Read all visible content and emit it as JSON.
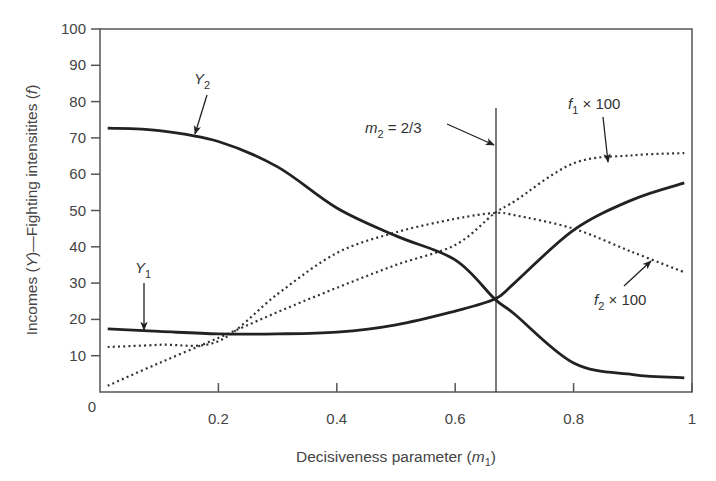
{
  "chart_data": {
    "type": "line",
    "title": "",
    "xlabel": "Decisiveness parameter (m1)",
    "xlabel_parts": {
      "main": "Decisiveness parameter (",
      "var": "m",
      "sub": "1",
      "close": ")"
    },
    "ylabel": "Incomes (Y)—Fighting intensitites (f)",
    "ylabel_parts": {
      "a": "Incomes (",
      "b": "Y",
      "c": ")—Fighting intensitites (",
      "d": "f",
      "e": ")"
    },
    "xlim": [
      0,
      1
    ],
    "ylim": [
      0,
      100
    ],
    "xticks": [
      0.2,
      0.4,
      0.6,
      0.8,
      1
    ],
    "xtick_labels": [
      "0.2",
      "0.4",
      "0.6",
      "0.8",
      "1"
    ],
    "origin_label": "0",
    "yticks": [
      10,
      20,
      30,
      40,
      50,
      60,
      70,
      80,
      90,
      100
    ],
    "ytick_labels": [
      "10",
      "20",
      "30",
      "40",
      "50",
      "60",
      "70",
      "80",
      "90",
      "100"
    ],
    "grid": false,
    "legend": "none (inline annotations)",
    "x": [
      0.013,
      0.1,
      0.2,
      0.3,
      0.4,
      0.5,
      0.6,
      0.667,
      0.7,
      0.8,
      0.9,
      0.987
    ],
    "series": [
      {
        "name": "Y2",
        "style": "solid",
        "values": [
          72.7,
          72.0,
          69.0,
          62.0,
          50.7,
          43.0,
          36.4,
          25.6,
          21.5,
          8.0,
          4.8,
          3.9
        ]
      },
      {
        "name": "Y1",
        "style": "solid",
        "values": [
          17.4,
          16.7,
          16.0,
          16.0,
          16.5,
          18.5,
          22.3,
          25.6,
          30.0,
          44.6,
          53.0,
          57.6
        ]
      },
      {
        "name": "f1 × 100",
        "style": "dotted",
        "values": [
          1.7,
          8.0,
          14.9,
          22.0,
          28.7,
          35.0,
          40.5,
          49.3,
          52.5,
          63.0,
          65.2,
          65.8
        ]
      },
      {
        "name": "f2 × 100",
        "style": "dotted",
        "values": [
          12.4,
          13.0,
          14.0,
          27.0,
          38.3,
          44.0,
          47.7,
          49.3,
          48.7,
          45.0,
          38.5,
          33.0
        ]
      }
    ],
    "annotations": [
      {
        "text": "Y2",
        "main": "Y",
        "sub": "2",
        "points_to": "Y2 curve near m1=0.16"
      },
      {
        "text": "Y1",
        "main": "Y",
        "sub": "1",
        "points_to": "Y1 curve near m1=0.07"
      },
      {
        "text": "m2 = 2/3",
        "main": "m",
        "sub": "2",
        "rest": " = 2/3",
        "points_to": "vertical line at m1=2/3"
      },
      {
        "text": "f1 × 100",
        "main": "f",
        "sub": "1",
        "rest": " × 100",
        "points_to": "f1 curve near m1=0.86"
      },
      {
        "text": "f2 × 100",
        "main": "f",
        "sub": "2",
        "rest": " × 100",
        "points_to": "f2 curve near m1=0.91"
      }
    ],
    "vertical_line": {
      "x": 0.667,
      "label": "m2 = 2/3"
    }
  },
  "colors": {
    "axis": "#555555",
    "curve": "#222222",
    "text": "#444444",
    "background": "#ffffff"
  }
}
